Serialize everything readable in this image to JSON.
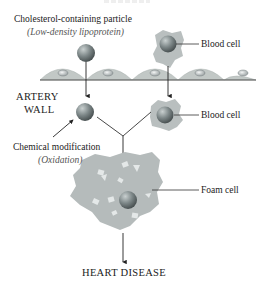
{
  "diagram": {
    "labels": {
      "particle": "Cholesterol-containing particle",
      "particle_sub": "(Low-density lipoprotein)",
      "blood_cell_top": "Blood cell",
      "artery_wall_line1": "ARTERY",
      "artery_wall_line2": "WALL",
      "blood_cell_mid": "Blood cell",
      "chem_mod": "Chemical modification",
      "chem_mod_sub": "(Oxidation)",
      "foam_cell": "Foam cell",
      "outcome": "HEART DISEASE"
    },
    "colors": {
      "particle": "#7f8a8c",
      "cell_body": "#b9bfbf",
      "wall": "#c2c8c6",
      "line": "#333333",
      "foam_dots": "#e6eaea"
    }
  }
}
